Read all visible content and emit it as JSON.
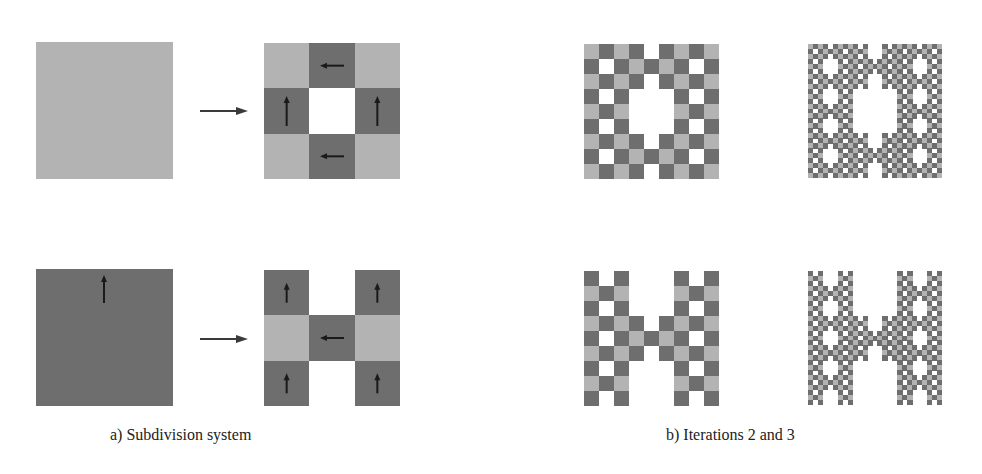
{
  "colors": {
    "light": "#b3b3b3",
    "dark": "#6e6e6e",
    "empty": "#ffffff",
    "arrow": "#1a1a1a",
    "rule_arrow": "#3a3a3a"
  },
  "panel_a": {
    "caption": "a)  Subdivision system",
    "rules": [
      {
        "input": {
          "tile": "L",
          "arrow": "none"
        },
        "output_grid": [
          [
            "L",
            "D",
            "L"
          ],
          [
            "D",
            "W",
            "D"
          ],
          [
            "L",
            "D",
            "L"
          ]
        ],
        "output_arrows": [
          [
            "none",
            "left",
            "none"
          ],
          [
            "up",
            "none",
            "up"
          ],
          [
            "none",
            "left",
            "none"
          ]
        ]
      },
      {
        "input": {
          "tile": "D",
          "arrow": "up"
        },
        "output_grid": [
          [
            "D",
            "W",
            "D"
          ],
          [
            "L",
            "D",
            "L"
          ],
          [
            "D",
            "W",
            "D"
          ]
        ],
        "output_arrows": [
          [
            "up",
            "none",
            "up"
          ],
          [
            "none",
            "left",
            "none"
          ],
          [
            "up",
            "none",
            "up"
          ]
        ]
      }
    ]
  },
  "panel_b": {
    "caption": "b)  Iterations 2 and 3",
    "iterations": [
      2,
      3
    ],
    "seeds": [
      "L",
      "D"
    ]
  }
}
